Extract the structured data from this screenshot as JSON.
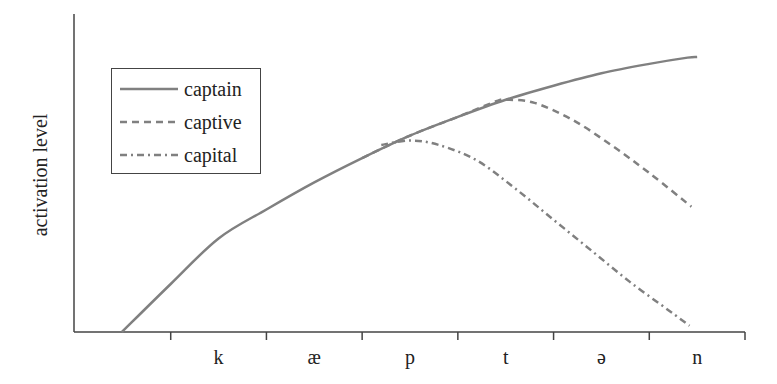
{
  "chart_data": {
    "type": "line",
    "title": "",
    "xlabel": "",
    "ylabel": "activation level",
    "x_categories": [
      "k",
      "æ",
      "p",
      "t",
      "ə",
      "n"
    ],
    "x_tick_positions": [
      0,
      1,
      2,
      3,
      4,
      5,
      6,
      7
    ],
    "x_label_positions": [
      1.5,
      2.5,
      3.5,
      4.5,
      5.5,
      6.5
    ],
    "xlim": [
      0,
      7
    ],
    "ylim": [
      0,
      1
    ],
    "grid": false,
    "legend_position": "upper left",
    "series": [
      {
        "name": "captain",
        "style": "solid",
        "color": "#808080",
        "points": [
          [
            0.49,
            0.0
          ],
          [
            1.0,
            0.154
          ],
          [
            1.5,
            0.3
          ],
          [
            2.0,
            0.393
          ],
          [
            2.5,
            0.48
          ],
          [
            3.0,
            0.558
          ],
          [
            3.5,
            0.63
          ],
          [
            4.0,
            0.69
          ],
          [
            4.5,
            0.745
          ],
          [
            5.0,
            0.79
          ],
          [
            5.5,
            0.83
          ],
          [
            6.0,
            0.86
          ],
          [
            6.5,
            0.882
          ],
          [
            6.4,
            0.88
          ]
        ]
      },
      {
        "name": "captive",
        "style": "dashed",
        "color": "#808080",
        "points": [
          [
            3.0,
            0.558
          ],
          [
            3.5,
            0.63
          ],
          [
            4.0,
            0.69
          ],
          [
            4.4,
            0.74
          ],
          [
            4.5,
            0.745
          ],
          [
            4.8,
            0.735
          ],
          [
            5.2,
            0.68
          ],
          [
            5.6,
            0.6
          ],
          [
            6.0,
            0.51
          ],
          [
            6.44,
            0.402
          ]
        ]
      },
      {
        "name": "capital",
        "style": "dash-dot",
        "color": "#808080",
        "points": [
          [
            3.2,
            0.6
          ],
          [
            3.5,
            0.614
          ],
          [
            3.8,
            0.6
          ],
          [
            4.2,
            0.55
          ],
          [
            4.6,
            0.46
          ],
          [
            5.0,
            0.36
          ],
          [
            5.4,
            0.26
          ],
          [
            5.8,
            0.16
          ],
          [
            6.2,
            0.07
          ],
          [
            6.42,
            0.02
          ]
        ]
      }
    ]
  },
  "axis": {
    "ylabel": "activation level",
    "xlabels": [
      "k",
      "æ",
      "p",
      "t",
      "ə",
      "n"
    ]
  },
  "legend": {
    "items": [
      {
        "label": "captain",
        "style": "solid"
      },
      {
        "label": "captive",
        "style": "dashed"
      },
      {
        "label": "capital",
        "style": "dash-dot"
      }
    ]
  },
  "colors": {
    "axis": "#444444",
    "series": "#808080"
  }
}
